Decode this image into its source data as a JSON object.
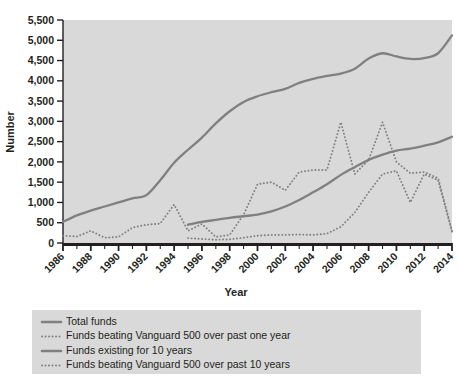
{
  "chart_data": {
    "type": "line",
    "title": "",
    "xlabel": "Year",
    "ylabel": "Number",
    "xlim": [
      1986,
      2014
    ],
    "ylim": [
      0,
      5500
    ],
    "ytick_labels": [
      "0",
      "500",
      "1,000",
      "1,500",
      "2,000",
      "2,500",
      "3,000",
      "3,500",
      "4,000",
      "4,500",
      "5,000",
      "5,500"
    ],
    "ytick_values": [
      0,
      500,
      1000,
      1500,
      2000,
      2500,
      3000,
      3500,
      4000,
      4500,
      5000,
      5500
    ],
    "xtick_labels": [
      "1986",
      "1988",
      "1990",
      "1992",
      "1994",
      "1996",
      "1998",
      "2000",
      "2002",
      "2004",
      "2006",
      "2008",
      "2010",
      "2012",
      "2014"
    ],
    "xtick_values": [
      1986,
      1988,
      1990,
      1992,
      1994,
      1996,
      1998,
      2000,
      2002,
      2004,
      2006,
      2008,
      2010,
      2012,
      2014
    ],
    "grid": false,
    "legend_position": "below",
    "plot_bg_color": "#d9d9d9",
    "line_color": "#808080",
    "series": [
      {
        "name": "Total funds",
        "style": "solid",
        "x": [
          1986,
          1987,
          1988,
          1989,
          1990,
          1991,
          1992,
          1993,
          1994,
          1995,
          1996,
          1997,
          1998,
          1999,
          2000,
          2001,
          2002,
          2003,
          2004,
          2005,
          2006,
          2007,
          2008,
          2009,
          2010,
          2011,
          2012,
          2013,
          2014
        ],
        "values": [
          520,
          680,
          800,
          900,
          1000,
          1100,
          1180,
          1550,
          1980,
          2300,
          2600,
          2950,
          3250,
          3480,
          3620,
          3720,
          3800,
          3950,
          4050,
          4120,
          4180,
          4300,
          4550,
          4680,
          4600,
          4540,
          4560,
          4680,
          5120
        ]
      },
      {
        "name": "Funds beating Vanguard 500 over past one year",
        "style": "dotted",
        "x": [
          1986,
          1987,
          1988,
          1989,
          1990,
          1991,
          1992,
          1993,
          1994,
          1995,
          1996,
          1997,
          1998,
          1999,
          2000,
          2001,
          2002,
          2003,
          2004,
          2005,
          2006,
          2007,
          2008,
          2009,
          2010,
          2011,
          2012,
          2013,
          2014
        ],
        "values": [
          180,
          160,
          300,
          130,
          150,
          380,
          450,
          480,
          950,
          300,
          470,
          150,
          200,
          700,
          1450,
          1500,
          1300,
          1750,
          1800,
          1800,
          2980,
          1700,
          2050,
          2980,
          2000,
          1720,
          1750,
          1600,
          300
        ]
      },
      {
        "name": "Funds existing for 10 years",
        "style": "solid",
        "x": [
          1995,
          1996,
          1997,
          1998,
          1999,
          2000,
          2001,
          2002,
          2003,
          2004,
          2005,
          2006,
          2007,
          2008,
          2009,
          2010,
          2011,
          2012,
          2013,
          2014
        ],
        "values": [
          450,
          520,
          570,
          620,
          660,
          700,
          780,
          900,
          1060,
          1250,
          1450,
          1680,
          1870,
          2050,
          2180,
          2280,
          2330,
          2400,
          2480,
          2620
        ]
      },
      {
        "name": "Funds beating Vanguard 500 over past 10 years",
        "style": "dotted",
        "x": [
          1995,
          1996,
          1997,
          1998,
          1999,
          2000,
          2001,
          2002,
          2003,
          2004,
          2005,
          2006,
          2007,
          2008,
          2009,
          2010,
          2011,
          2012,
          2013,
          2014
        ],
        "values": [
          120,
          100,
          80,
          90,
          130,
          180,
          200,
          200,
          210,
          200,
          230,
          400,
          750,
          1250,
          1700,
          1780,
          1000,
          1700,
          1550,
          280
        ]
      }
    ]
  },
  "legend": {
    "items": [
      {
        "label": "Total funds",
        "style": "solid"
      },
      {
        "label": "Funds beating Vanguard 500 over past one year",
        "style": "dotted"
      },
      {
        "label": "Funds existing for 10 years",
        "style": "solid"
      },
      {
        "label": "Funds beating Vanguard 500 over past 10 years",
        "style": "dotted"
      }
    ]
  }
}
